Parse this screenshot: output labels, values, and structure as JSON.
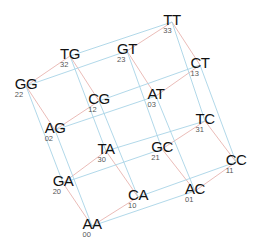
{
  "diagram": {
    "colors": {
      "square_edge": "#e8b4b0",
      "cross_edge": "#a8d4e6",
      "label": "#111111",
      "code": "#555555"
    },
    "nodes": [
      {
        "label": "TT",
        "code": "33",
        "x": 172,
        "y": 22
      },
      {
        "label": "GT",
        "code": "23",
        "x": 127,
        "y": 51
      },
      {
        "label": "CT",
        "code": "13",
        "x": 200,
        "y": 65
      },
      {
        "label": "AT",
        "code": "03",
        "x": 156,
        "y": 96
      },
      {
        "label": "TG",
        "code": "32",
        "x": 70,
        "y": 56
      },
      {
        "label": "GG",
        "code": "22",
        "x": 26,
        "y": 86
      },
      {
        "label": "CG",
        "code": "12",
        "x": 99,
        "y": 101
      },
      {
        "label": "AG",
        "code": "02",
        "x": 55,
        "y": 130
      },
      {
        "label": "TC",
        "code": "31",
        "x": 205,
        "y": 121
      },
      {
        "label": "GC",
        "code": "21",
        "x": 162,
        "y": 149
      },
      {
        "label": "CC",
        "code": "11",
        "x": 236,
        "y": 162
      },
      {
        "label": "AC",
        "code": "01",
        "x": 195,
        "y": 191
      },
      {
        "label": "TA",
        "code": "30",
        "x": 106,
        "y": 151
      },
      {
        "label": "GA",
        "code": "20",
        "x": 63,
        "y": 183
      },
      {
        "label": "CA",
        "code": "10",
        "x": 138,
        "y": 197
      },
      {
        "label": "AA",
        "code": "00",
        "x": 92,
        "y": 226
      }
    ]
  }
}
